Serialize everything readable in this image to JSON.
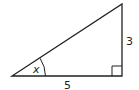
{
  "diagram": {
    "type": "right-triangle",
    "labels": {
      "angle": "x",
      "base": "5",
      "height": "3"
    },
    "colors": {
      "stroke": "#231f20",
      "background": "#ffffff"
    }
  }
}
